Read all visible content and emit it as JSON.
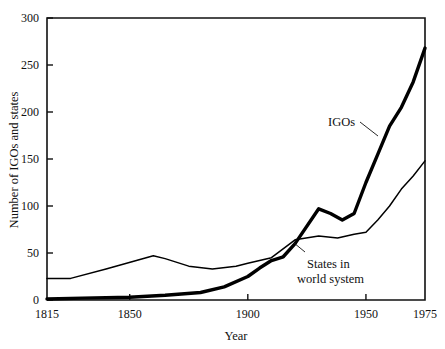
{
  "chart_data": {
    "type": "line",
    "title": "",
    "xlabel": "Year",
    "ylabel": "Number of IGOs and states",
    "xlim": [
      1815,
      1975
    ],
    "ylim": [
      0,
      300
    ],
    "grid": false,
    "legend_position": "inline-annotations",
    "xticks": [
      1815,
      1850,
      1900,
      1950,
      1975
    ],
    "xtick_labels": [
      "1815",
      "1850",
      "1900",
      "1950",
      "1975"
    ],
    "yticks": [
      0,
      50,
      100,
      150,
      200,
      250,
      300
    ],
    "ytick_labels": [
      "0",
      "50",
      "100",
      "150",
      "200",
      "250",
      "300"
    ],
    "annotations": [
      {
        "text": "IGOs",
        "x": 1933,
        "y": 178
      },
      {
        "text": "States in",
        "x": 1928,
        "y": 42
      },
      {
        "text": "world system",
        "x": 1930,
        "y": 28
      }
    ],
    "series": [
      {
        "name": "IGOs",
        "style": "thick",
        "x": [
          1815,
          1830,
          1850,
          1865,
          1880,
          1890,
          1900,
          1905,
          1910,
          1915,
          1920,
          1930,
          1935,
          1940,
          1945,
          1950,
          1955,
          1960,
          1965,
          1970,
          1975
        ],
        "values": [
          1,
          2,
          3,
          5,
          8,
          14,
          25,
          34,
          42,
          46,
          60,
          97,
          92,
          85,
          92,
          125,
          155,
          185,
          205,
          232,
          268
        ]
      },
      {
        "name": "States in world system",
        "style": "thin",
        "x": [
          1815,
          1825,
          1840,
          1860,
          1865,
          1875,
          1885,
          1895,
          1900,
          1905,
          1910,
          1920,
          1930,
          1938,
          1945,
          1950,
          1955,
          1960,
          1965,
          1970,
          1975
        ],
        "values": [
          23,
          23,
          33,
          47,
          44,
          36,
          33,
          36,
          39,
          42,
          45,
          64,
          68,
          66,
          70,
          72,
          85,
          100,
          118,
          132,
          148
        ]
      }
    ]
  },
  "figure": {
    "background_color": "#ffffff",
    "ink_color": "#000000"
  }
}
